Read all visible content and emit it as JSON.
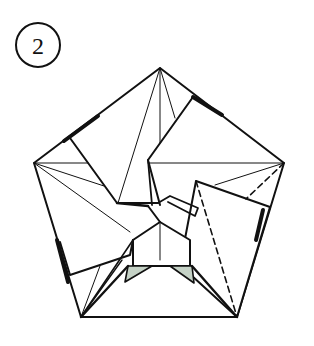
{
  "diagram": {
    "type": "origami-fold-step",
    "step": {
      "number": "2",
      "badge_shape": "circle"
    },
    "colors": {
      "line": "#111111",
      "paper": "#ffffff",
      "shaded_flap": "#c5d2c6"
    },
    "line_types": {
      "solid": "fold edges / paper edges",
      "dashed": "valley fold line"
    }
  }
}
